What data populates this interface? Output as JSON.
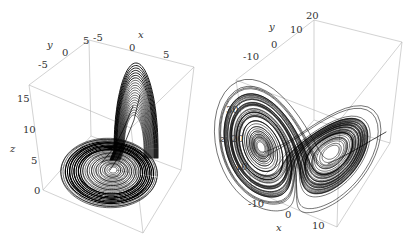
{
  "figure": {
    "panels": [
      {
        "id": "left",
        "description": "3D trajectory plot of a strange attractor (single-scroll spiral with lobe)",
        "axes": {
          "x": {
            "label": "x",
            "ticks": [
              "-5",
              "0",
              "5"
            ]
          },
          "y": {
            "label": "y",
            "ticks": [
              "-5",
              "0",
              "5"
            ]
          },
          "z": {
            "label": "z",
            "ticks": [
              "0",
              "5",
              "10",
              "15"
            ]
          }
        }
      },
      {
        "id": "right",
        "description": "3D trajectory plot of the Lorenz butterfly attractor",
        "axes": {
          "x": {
            "label": "x",
            "ticks": [
              "-10",
              "0",
              "10"
            ]
          },
          "y": {
            "label": "y",
            "ticks": [
              "-10",
              "0",
              "10",
              "20"
            ]
          },
          "z": {
            "label": "z",
            "ticks": [
              "10",
              "20",
              "30"
            ]
          }
        }
      }
    ],
    "colors": {
      "trajectory": "#000000",
      "box_edges": "#b4b4b4",
      "background": "#ffffff"
    }
  },
  "chart_data": [
    {
      "type": "scatter",
      "subtype": "3d-line",
      "title": "",
      "xlabel": "x",
      "ylabel": "y",
      "zlabel": "z",
      "xticks": [
        -5,
        0,
        5
      ],
      "yticks": [
        -5,
        0,
        5
      ],
      "zticks": [
        0,
        5,
        10,
        15
      ],
      "xlim": [
        -8,
        9
      ],
      "ylim": [
        -8,
        6
      ],
      "zlim": [
        0,
        18
      ],
      "grid": false,
      "legend": null,
      "notes": "Dense spiral trajectory centered near (x≈0,y≈0,z≈3) with an upward lobe reaching z≈17 at x≈3"
    },
    {
      "type": "scatter",
      "subtype": "3d-line",
      "title": "",
      "xlabel": "x",
      "ylabel": "y",
      "zlabel": "z",
      "xticks": [
        -10,
        0,
        10
      ],
      "yticks": [
        -10,
        0,
        10,
        20
      ],
      "zticks": [
        10,
        20,
        30
      ],
      "xlim": [
        -15,
        15
      ],
      "ylim": [
        -15,
        22
      ],
      "zlim": [
        5,
        40
      ],
      "grid": false,
      "legend": null,
      "notes": "Two-lobed butterfly attractor; left lobe dense around hole at z≈30, right lobe elongated"
    }
  ]
}
